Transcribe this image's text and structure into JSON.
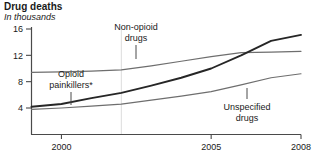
{
  "header": {
    "title": "Drug deaths",
    "subtitle": "In thousands"
  },
  "chart_data": {
    "type": "line",
    "title": "Drug deaths",
    "subtitle": "In thousands",
    "xlabel": "",
    "ylabel": "In thousands",
    "xlim": [
      1999,
      2008
    ],
    "ylim": [
      0,
      16
    ],
    "yticks": [
      4,
      8,
      12,
      16
    ],
    "ytick_labels": [
      "4",
      "8",
      "12",
      "16"
    ],
    "xticks": [
      2000,
      2005,
      2008
    ],
    "xtick_labels": [
      "2000",
      "2005",
      "2008"
    ],
    "grid": "single faint vertical gridline at 2002",
    "gridline_x": 2002,
    "legend": "inline labels with leader lines",
    "x": [
      1999,
      2000,
      2001,
      2002,
      2003,
      2004,
      2005,
      2006,
      2007,
      2008
    ],
    "series": [
      {
        "name": "Non-opioid drugs",
        "color": "#6e6e6e",
        "values": [
          9.4,
          9.5,
          9.6,
          9.8,
          10.4,
          11.1,
          11.8,
          12.4,
          12.5,
          12.6
        ],
        "label_x": 2002.6,
        "label_y": 15.6
      },
      {
        "name": "Opioid painkillers*",
        "color": "#262626",
        "values": [
          4.2,
          4.6,
          5.5,
          6.3,
          7.4,
          8.6,
          10.0,
          12.0,
          14.2,
          15.1
        ],
        "label_x": 2000.6,
        "label_y": 7.9
      },
      {
        "name": "Unspecified drugs",
        "color": "#6e6e6e",
        "values": [
          3.8,
          4.0,
          4.3,
          4.6,
          5.2,
          5.8,
          6.5,
          7.5,
          8.6,
          9.2
        ],
        "label_x": 2005.3,
        "label_y": 4.4
      }
    ],
    "annotations": [
      {
        "text": "Non-opioid drugs",
        "series": "Non-opioid drugs",
        "leader": true
      },
      {
        "text": "Opioid painkillers*",
        "series": "Opioid painkillers*",
        "leader": true
      },
      {
        "text": "Unspecified drugs",
        "series": "Unspecified drugs",
        "leader": true
      }
    ],
    "series_labels": {
      "non_opioid_line1": "Non-opioid",
      "non_opioid_line2": "drugs",
      "opioid_line1": "Opioid",
      "opioid_line2": "painkillers*",
      "unspecified_line1": "Unspecified",
      "unspecified_line2": "drugs"
    },
    "axis_color": "#4a4a4a",
    "gridline_color": "#dcdcdc"
  }
}
